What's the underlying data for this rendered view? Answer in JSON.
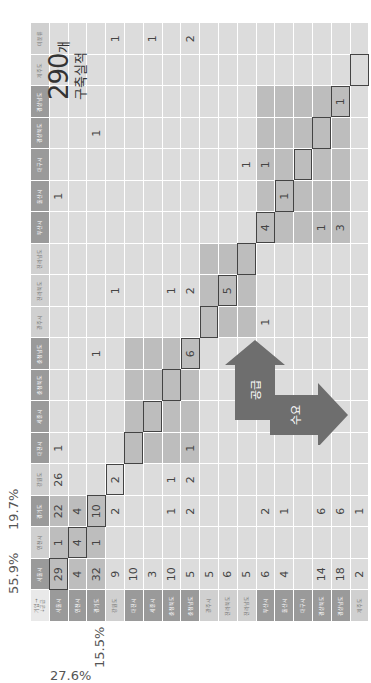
{
  "corner_label": {
    "line1": "기업→",
    "line2": "↓공급"
  },
  "demand_regions": [
    "서울시",
    "인천시",
    "경기도",
    "강원도",
    "대전시",
    "세종시",
    "충청북도",
    "충청남도",
    "광주시",
    "전라북도",
    "전라남도",
    "부산시",
    "울산시",
    "대구시",
    "경상북도",
    "경상남도",
    "제주도",
    "미분류"
  ],
  "supply_regions": [
    "서울시",
    "인천시",
    "경기도",
    "강원도",
    "대전시",
    "세종시",
    "충청북도",
    "충청남도",
    "광주시",
    "전라북도",
    "전라남도",
    "부산시",
    "울산시",
    "대구시",
    "경상북도",
    "경상남도",
    "제주도"
  ],
  "percentages": {
    "demand_seoul": "55.9%",
    "demand_gyeonggi": "19.7%",
    "supply_seoul": "27.6%",
    "supply_gyeonggi": "15.5%"
  },
  "total": {
    "number": "290",
    "unit": "개",
    "label": "구축실적"
  },
  "arrows": {
    "supply_label": "공급",
    "demand_label": "수요"
  },
  "matrix": [
    [
      "29",
      "1",
      "22",
      "26",
      "1",
      "",
      "",
      "",
      "",
      "",
      "",
      "",
      "1",
      "",
      "",
      "",
      "",
      ""
    ],
    [
      "4",
      "4",
      "4",
      "",
      "",
      "",
      "",
      "",
      "",
      "",
      "",
      "",
      "",
      "",
      "",
      "",
      "",
      ""
    ],
    [
      "32",
      "1",
      "10",
      "",
      "",
      "",
      "",
      "1",
      "",
      "",
      "",
      "",
      "",
      "",
      "1",
      "",
      "",
      ""
    ],
    [
      "9",
      "",
      "2",
      "2",
      "",
      "",
      "",
      "",
      "",
      "1",
      "",
      "",
      "",
      "",
      "",
      "",
      "",
      "1"
    ],
    [
      "10",
      "",
      "",
      "",
      "",
      "",
      "",
      "",
      "",
      "",
      "",
      "",
      "",
      "",
      "",
      "",
      "",
      ""
    ],
    [
      "3",
      "",
      "",
      "",
      "",
      "",
      "",
      "",
      "",
      "",
      "",
      "",
      "",
      "",
      "",
      "",
      "",
      "1"
    ],
    [
      "10",
      "",
      "1",
      "1",
      "",
      "",
      "",
      "",
      "",
      "1",
      "",
      "",
      "",
      "",
      "",
      "",
      "",
      ""
    ],
    [
      "5",
      "",
      "2",
      "2",
      "1",
      "",
      "",
      "6",
      "",
      "2",
      "",
      "",
      "",
      "",
      "",
      "",
      "",
      "2"
    ],
    [
      "5",
      "",
      "",
      "",
      "",
      "",
      "",
      "",
      "",
      "",
      "",
      "",
      "",
      "",
      "",
      "",
      "",
      ""
    ],
    [
      "6",
      "",
      "",
      "",
      "",
      "",
      "",
      "",
      "",
      "5",
      "",
      "",
      "",
      "",
      "",
      "",
      "",
      ""
    ],
    [
      "5",
      "",
      "",
      "",
      "",
      "",
      "",
      "",
      "",
      "",
      "",
      "",
      "",
      "1",
      "",
      "",
      "",
      ""
    ],
    [
      "6",
      "",
      "2",
      "",
      "",
      "",
      "",
      "",
      "1",
      "",
      "",
      "4",
      "",
      "1",
      "",
      "",
      "",
      ""
    ],
    [
      "4",
      "",
      "1",
      "",
      "",
      "",
      "",
      "",
      "",
      "",
      "",
      "",
      "1",
      "",
      "",
      "",
      "",
      ""
    ],
    [
      "",
      "",
      "",
      "",
      "",
      "",
      "",
      "",
      "",
      "",
      "",
      "",
      "",
      "",
      "",
      "",
      "",
      ""
    ],
    [
      "14",
      "",
      "6",
      "",
      "",
      "",
      "",
      "",
      "",
      "",
      "",
      "1",
      "",
      "",
      "",
      "",
      "",
      ""
    ],
    [
      "18",
      "",
      "6",
      "",
      "",
      "",
      "",
      "",
      "",
      "",
      "",
      "3",
      "",
      "",
      "",
      "1",
      "",
      ""
    ],
    [
      "2",
      "",
      "1",
      "",
      "",
      "",
      "",
      "",
      "",
      "",
      "",
      "",
      "",
      "",
      "",
      "",
      "",
      ""
    ]
  ],
  "colors": {
    "header_dark": "#9a9a9a",
    "header_light": "#d0d0d0",
    "cell": "#dcdcdc",
    "highlight": "#bdbdbd",
    "arrow": "#6e6e6e"
  }
}
